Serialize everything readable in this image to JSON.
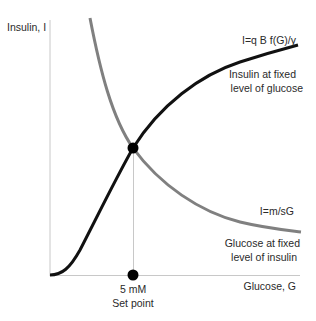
{
  "axes": {
    "y_label": "Insulin, I",
    "x_label": "Glucose, G"
  },
  "curves": {
    "insulin_curve": {
      "equation": "I=q B f(G)/γ",
      "caption_line1": "Insulin at fixed",
      "caption_line2": "level of glucose",
      "color": "#111111"
    },
    "glucose_curve": {
      "equation": "I=m/sG",
      "caption_line1": "Glucose at fixed",
      "caption_line2": "level of insulin",
      "color": "#808080"
    }
  },
  "set_point": {
    "value": "5 mM",
    "label": "Set point"
  },
  "colors": {
    "axis": "#c8c8c8",
    "dot": "#000000"
  }
}
